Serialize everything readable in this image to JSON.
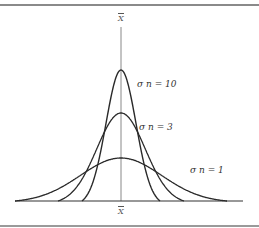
{
  "diagram": {
    "center_label_top": "X",
    "center_label_bottom": "X",
    "curves": [
      {
        "label": "σ n = 10",
        "n": 10,
        "peak_y": 70,
        "half_width": 39,
        "color": "#2a2a2a"
      },
      {
        "label": "σ n = 3",
        "n": 3,
        "peak_y": 113,
        "half_width": 63,
        "color": "#2a2a2a"
      },
      {
        "label": "σ n = 1",
        "n": 1,
        "peak_y": 158,
        "half_width": 106,
        "color": "#2a2a2a"
      }
    ],
    "axis": {
      "baseline_y": 201,
      "x_start": 15,
      "x_end": 243,
      "center_x": 121
    }
  }
}
